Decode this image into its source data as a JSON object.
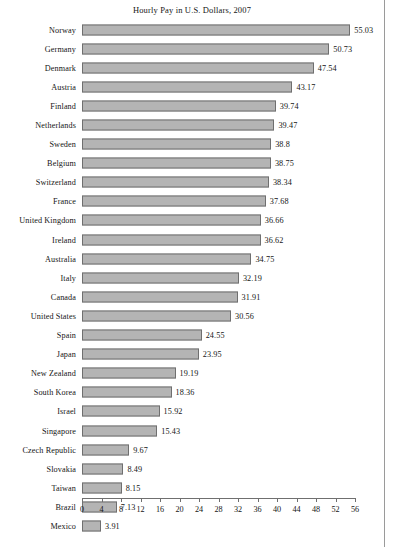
{
  "chart_data": {
    "type": "bar",
    "orientation": "horizontal",
    "title": "Hourly Pay in U.S. Dollars, 2007",
    "xlabel": "",
    "ylabel": "",
    "xlim": [
      0,
      56
    ],
    "xticks": [
      0,
      4,
      8,
      12,
      16,
      20,
      24,
      28,
      32,
      36,
      40,
      44,
      48,
      52,
      56
    ],
    "grid": false,
    "legend": null,
    "bar_color": "#b4b4b4",
    "bar_border_color": "#6f6f6f",
    "value_labels": true,
    "categories": [
      "Norway",
      "Germany",
      "Denmark",
      "Austria",
      "Finland",
      "Netherlands",
      "Sweden",
      "Belgium",
      "Switzerland",
      "France",
      "United Kingdom",
      "Ireland",
      "Australia",
      "Italy",
      "Canada",
      "United States",
      "Spain",
      "Japan",
      "New Zealand",
      "South Korea",
      "Israel",
      "Singapore",
      "Czech Republic",
      "Slovakia",
      "Taiwan",
      "Brazil",
      "Mexico"
    ],
    "values": [
      55.03,
      50.73,
      47.54,
      43.17,
      39.74,
      39.47,
      38.8,
      38.75,
      38.34,
      37.68,
      36.66,
      36.62,
      34.75,
      32.19,
      31.91,
      30.56,
      24.55,
      23.95,
      19.19,
      18.36,
      15.92,
      15.43,
      9.67,
      8.49,
      8.15,
      7.13,
      3.91
    ],
    "value_label_texts": [
      "55.03",
      "50.73",
      "47.54",
      "43.17",
      "39.74",
      "39.47",
      "38.8",
      "38.75",
      "38.34",
      "37.68",
      "36.66",
      "36.62",
      "34.75",
      "32.19",
      "31.91",
      "30.56",
      "24.55",
      "23.95",
      "19.19",
      "18.36",
      "15.92",
      "15.43",
      "9.67",
      "8.49",
      "8.15",
      "7.13",
      "3.91"
    ]
  }
}
